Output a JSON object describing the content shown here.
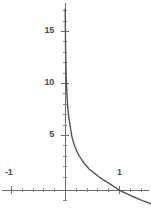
{
  "figure": {
    "name": "function-plot",
    "background_color": "#ffffff",
    "axis_color": "#6b6b6b",
    "curve_color": "#555555",
    "label_color": "#4a4a4a"
  },
  "labels": {
    "y_15": "15",
    "y_10": "10",
    "y_5": "5",
    "x_neg1": "-1",
    "x_1": "1"
  },
  "chart_data": {
    "type": "line",
    "title": "",
    "xlabel": "",
    "ylabel": "",
    "function": "-ln(x)",
    "grid": false,
    "legend": null,
    "axis_style": "cartesian-cross",
    "origin_px": [
      65,
      190
    ],
    "px_per_unit_x": 54,
    "px_per_unit_y": 10.4,
    "xlim": [
      -1.2,
      1.6
    ],
    "ylim": [
      -1.0,
      18.0
    ],
    "xticks": [
      -1,
      1
    ],
    "xtick_labels": [
      "-1",
      "1"
    ],
    "yticks": [
      5,
      10,
      15
    ],
    "ytick_labels": [
      "5",
      "10",
      "15"
    ],
    "minor_xtick_step": 0.2,
    "minor_ytick_step": 1,
    "x": [
      0.0045,
      0.006,
      0.008,
      0.01,
      0.013,
      0.017,
      0.022,
      0.029,
      0.038,
      0.05,
      0.065,
      0.082,
      0.1,
      0.125,
      0.15,
      0.18,
      0.22,
      0.26,
      0.3,
      0.35,
      0.4,
      0.45,
      0.5,
      0.56,
      0.62,
      0.7,
      0.78,
      0.86,
      0.93,
      1.0,
      1.1,
      1.2,
      1.3,
      1.4,
      1.5,
      1.6
    ],
    "y": [
      17.4,
      16.12,
      15.05,
      13.82,
      13.0,
      12.0,
      11.0,
      10.0,
      9.0,
      8.0,
      7.2,
      6.6,
      6.0,
      5.2,
      4.7,
      4.2,
      3.7,
      3.3,
      3.0,
      2.6,
      2.3,
      2.0,
      1.8,
      1.55,
      1.3,
      1.0,
      0.75,
      0.5,
      0.25,
      0.0,
      -0.25,
      -0.5,
      -0.72,
      -0.95,
      -1.15,
      -1.35
    ]
  }
}
